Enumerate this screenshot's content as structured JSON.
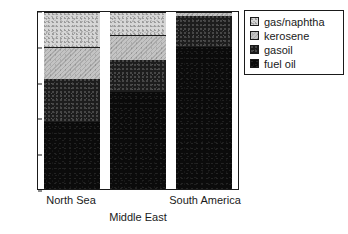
{
  "chart_data": {
    "type": "bar",
    "title": "",
    "subtitle": "",
    "xlabel": "",
    "ylabel": "",
    "stacked": true,
    "stack_total": 100,
    "grid": false,
    "legend_position": "right",
    "categories": [
      "North Sea",
      "Middle East",
      "South America"
    ],
    "ylim": [
      0,
      100
    ],
    "yticks": [
      0,
      20,
      40,
      60,
      80,
      100
    ],
    "ytick_labels": [
      "0",
      "20",
      "40",
      "60",
      "80",
      "100"
    ],
    "series": [
      {
        "name": "fuel oil",
        "values": [
          38,
          55,
          80
        ]
      },
      {
        "name": "gasoil",
        "values": [
          24,
          18,
          18
        ]
      },
      {
        "name": "kerosene",
        "values": [
          18,
          14,
          2
        ]
      },
      {
        "name": "gas/naphtha",
        "values": [
          20,
          13,
          0
        ]
      }
    ],
    "cumulative_tops": {
      "North Sea": {
        "fuel oil": 38,
        "gasoil": 62,
        "kerosene": 80,
        "gas/naphtha": 100
      },
      "Middle East": {
        "fuel oil": 55,
        "gasoil": 73,
        "kerosene": 87,
        "gas/naphtha": 100
      },
      "South America": {
        "fuel oil": 80,
        "gasoil": 98,
        "kerosene": 100,
        "gas/naphtha": 100
      }
    },
    "colors": {
      "fuel oil": "#0b0b0b",
      "gasoil": "#1d1d1d",
      "kerosene": "#bdbdbd",
      "gas/naphtha": "#d6d6d6",
      "axis": "#1a1a1a",
      "background": "#ffffff"
    }
  },
  "legend": {
    "items": [
      {
        "label": "gas/naphtha"
      },
      {
        "label": "kerosene"
      },
      {
        "label": "gasoil"
      },
      {
        "label": "fuel oil"
      }
    ]
  },
  "axes": {
    "y": {
      "ticks": [
        {
          "label": "100"
        },
        {
          "label": "80"
        },
        {
          "label": "60"
        },
        {
          "label": "40"
        },
        {
          "label": "20"
        },
        {
          "label": "0"
        }
      ]
    },
    "x": {
      "labels": [
        {
          "label": "North Sea"
        },
        {
          "label": "Middle East"
        },
        {
          "label": "South America"
        }
      ]
    }
  }
}
